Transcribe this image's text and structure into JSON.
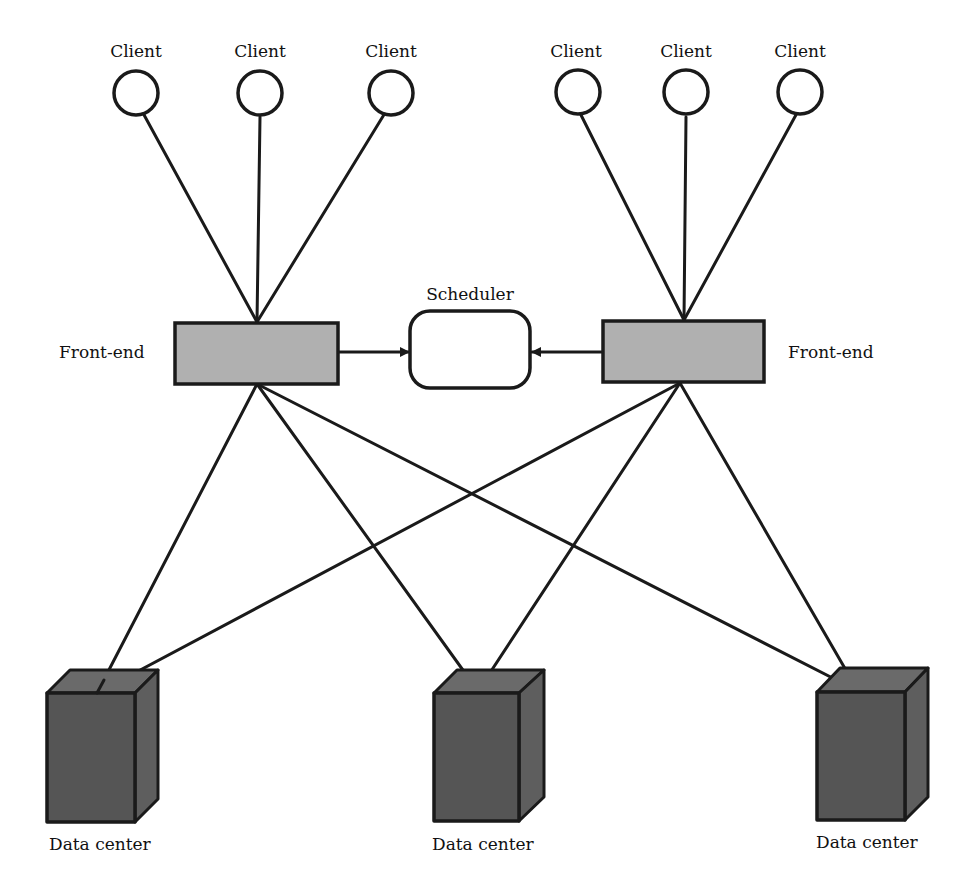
{
  "diagram": {
    "type": "network-architecture",
    "labels": {
      "client": "Client",
      "front_end": "Front-end",
      "scheduler": "Scheduler",
      "data_center": "Data center"
    },
    "clients": [
      {
        "id": "c1",
        "label": "Client",
        "group": "left"
      },
      {
        "id": "c2",
        "label": "Client",
        "group": "left"
      },
      {
        "id": "c3",
        "label": "Client",
        "group": "left"
      },
      {
        "id": "c4",
        "label": "Client",
        "group": "right"
      },
      {
        "id": "c5",
        "label": "Client",
        "group": "right"
      },
      {
        "id": "c6",
        "label": "Client",
        "group": "right"
      }
    ],
    "front_ends": [
      {
        "id": "fe1",
        "label": "Front-end",
        "position": "left"
      },
      {
        "id": "fe2",
        "label": "Front-end",
        "position": "right"
      }
    ],
    "scheduler": {
      "id": "sched",
      "label": "Scheduler"
    },
    "data_centers": [
      {
        "id": "dc1",
        "label": "Data center"
      },
      {
        "id": "dc2",
        "label": "Data center"
      },
      {
        "id": "dc3",
        "label": "Data center"
      }
    ],
    "edges": [
      {
        "from": "c1",
        "to": "fe1"
      },
      {
        "from": "c2",
        "to": "fe1"
      },
      {
        "from": "c3",
        "to": "fe1"
      },
      {
        "from": "c4",
        "to": "fe2"
      },
      {
        "from": "c5",
        "to": "fe2"
      },
      {
        "from": "c6",
        "to": "fe2"
      },
      {
        "from": "fe1",
        "to": "sched",
        "arrow": true
      },
      {
        "from": "fe2",
        "to": "sched",
        "arrow": true
      },
      {
        "from": "fe1",
        "to": "dc1"
      },
      {
        "from": "fe1",
        "to": "dc2"
      },
      {
        "from": "fe1",
        "to": "dc3"
      },
      {
        "from": "fe2",
        "to": "dc1"
      },
      {
        "from": "fe2",
        "to": "dc2"
      },
      {
        "from": "fe2",
        "to": "dc3"
      }
    ],
    "colors": {
      "line": "#1a1a1a",
      "front_end_fill": "#b0b0b0",
      "data_center_fill": "#555555",
      "background": "#ffffff"
    }
  }
}
